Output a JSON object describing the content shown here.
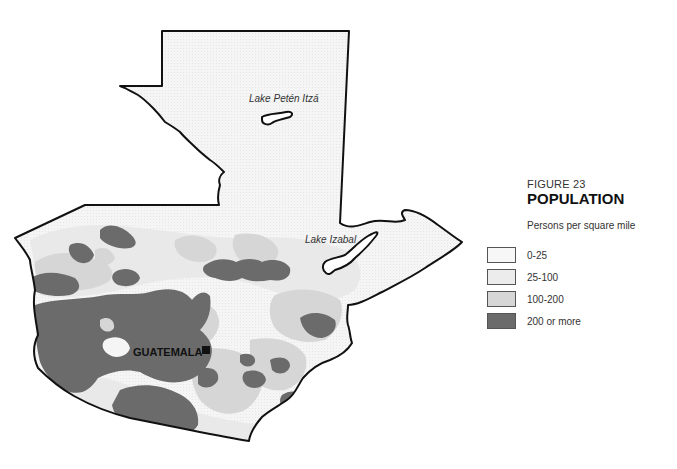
{
  "figure": {
    "number": "FIGURE 23",
    "title": "POPULATION",
    "subtitle": "Persons per square mile"
  },
  "legend": {
    "items": [
      {
        "label": "0-25",
        "color": "#f7f7f7"
      },
      {
        "label": "25-100",
        "color": "#ececec"
      },
      {
        "label": "100-200",
        "color": "#d6d6d6"
      },
      {
        "label": "200 or more",
        "color": "#6b6b6b"
      }
    ]
  },
  "map": {
    "country": "Guatemala",
    "labels": {
      "lake_peten": "Lake Petén Itzá",
      "lake_izabal": "Lake Izabal",
      "capital": "GUATEMALA"
    },
    "colors": {
      "outline": "#111111",
      "background": "#ffffff"
    }
  }
}
